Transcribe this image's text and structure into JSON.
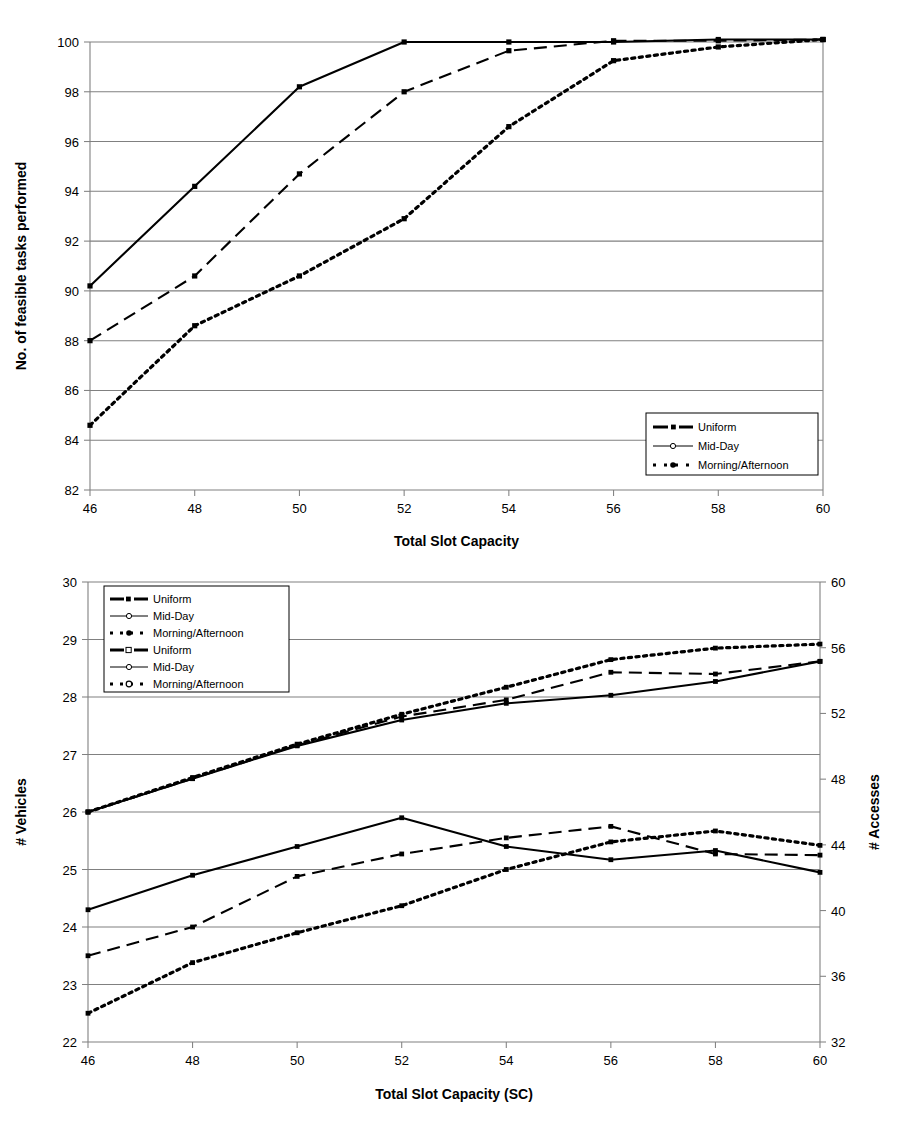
{
  "chart_data": [
    {
      "id": "top",
      "type": "line",
      "title": "",
      "xlabel": "Total Slot Capacity",
      "ylabel": "No. of feasible tasks performed",
      "x": [
        46,
        48,
        50,
        52,
        54,
        56,
        58,
        60
      ],
      "xticks": [
        "46",
        "48",
        "50",
        "52",
        "54",
        "56",
        "58",
        "60"
      ],
      "xlim": [
        46,
        60
      ],
      "ylim": [
        82,
        100
      ],
      "yticks": [
        "82",
        "84",
        "86",
        "88",
        "90",
        "92",
        "94",
        "96",
        "98",
        "100"
      ],
      "grid": true,
      "legend_position": "bottom-right",
      "series": [
        {
          "name": "Uniform",
          "style": "solid",
          "marker": "square",
          "values": [
            90.2,
            94.2,
            98.2,
            100.0,
            100.0,
            100.0,
            100.1,
            100.1
          ]
        },
        {
          "name": "Mid-Day",
          "style": "dashed",
          "marker": "square",
          "values": [
            88.0,
            90.6,
            94.7,
            98.0,
            99.65,
            100.05,
            100.05,
            100.1
          ]
        },
        {
          "name": "Morning/Afternoon",
          "style": "dotted",
          "marker": "square",
          "values": [
            84.6,
            88.6,
            90.6,
            92.9,
            96.6,
            99.25,
            99.8,
            100.1
          ]
        }
      ]
    },
    {
      "id": "bottom",
      "type": "line",
      "title": "",
      "xlabel": "Total Slot Capacity (SC)",
      "ylabel": "# Vehicles",
      "y2label": "# Accesses",
      "x": [
        46,
        48,
        50,
        52,
        54,
        56,
        58,
        60
      ],
      "xticks": [
        "46",
        "48",
        "50",
        "52",
        "54",
        "56",
        "58",
        "60"
      ],
      "xlim": [
        46,
        60
      ],
      "ylim": [
        22,
        30
      ],
      "yticks": [
        "22",
        "23",
        "24",
        "25",
        "26",
        "27",
        "28",
        "29",
        "30"
      ],
      "y2lim": [
        32,
        60
      ],
      "y2ticks": [
        "32",
        "36",
        "40",
        "44",
        "48",
        "52",
        "56",
        "60"
      ],
      "grid": true,
      "legend_position": "top-left",
      "series": [
        {
          "name": "Uniform",
          "axis": "left",
          "style": "solid",
          "marker": "square",
          "values": [
            24.3,
            24.9,
            25.4,
            25.9,
            25.4,
            25.17,
            25.33,
            24.95
          ]
        },
        {
          "name": "Mid-Day",
          "axis": "left",
          "style": "dashed",
          "marker": "square",
          "values": [
            23.5,
            24.0,
            24.88,
            25.27,
            25.55,
            25.75,
            25.27,
            25.25
          ]
        },
        {
          "name": "Morning/Afternoon",
          "axis": "left",
          "style": "dotted",
          "marker": "square",
          "values": [
            22.5,
            23.38,
            23.9,
            24.37,
            25.0,
            25.48,
            25.67,
            25.42
          ]
        },
        {
          "name": "Uniform",
          "axis": "right",
          "style": "solid",
          "marker": "square",
          "values": [
            26.0,
            26.58,
            27.15,
            27.6,
            27.89,
            28.03,
            28.27,
            28.62
          ]
        },
        {
          "name": "Mid-Day",
          "axis": "right",
          "style": "dashed",
          "marker": "square",
          "values": [
            26.0,
            26.58,
            27.16,
            27.66,
            27.95,
            28.43,
            28.4,
            28.62
          ]
        },
        {
          "name": "Morning/Afternoon",
          "axis": "right",
          "style": "dotted",
          "marker": "square",
          "values": [
            26.0,
            26.6,
            27.18,
            27.7,
            28.17,
            28.65,
            28.85,
            28.92
          ]
        }
      ],
      "legend_entries": [
        {
          "name": "Uniform",
          "style": "solid",
          "marker": "filled-square"
        },
        {
          "name": "Mid-Day",
          "style": "thin",
          "marker": "open-circle"
        },
        {
          "name": "Morning/Afternoon",
          "style": "dotted",
          "marker": "filled-circle"
        },
        {
          "name": "Uniform",
          "style": "solid",
          "marker": "open-square"
        },
        {
          "name": "Mid-Day",
          "style": "thin",
          "marker": "open-circle"
        },
        {
          "name": "Morning/Afternoon",
          "style": "dotted",
          "marker": "open-circle"
        }
      ]
    }
  ],
  "top_chart": {
    "ylabel": "No. of feasible tasks performed",
    "xlabel": "Total Slot Capacity",
    "legend_entries": [
      {
        "name": "Uniform",
        "style": "solid",
        "marker": "filled-square"
      },
      {
        "name": "Mid-Day",
        "style": "thin",
        "marker": "open-circle"
      },
      {
        "name": "Morning/Afternoon",
        "style": "dotted",
        "marker": "filled-circle"
      }
    ]
  },
  "bottom_chart": {
    "ylabel": "# Vehicles",
    "y2label": "# Accesses",
    "xlabel": "Total Slot Capacity (SC)"
  }
}
